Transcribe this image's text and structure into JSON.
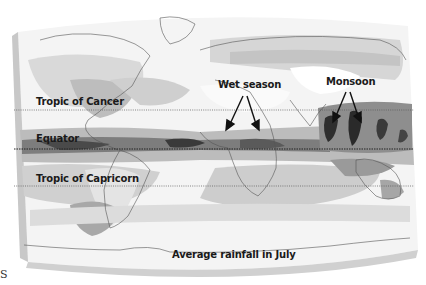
{
  "map": {
    "title": "Average rainfall in July",
    "labels": {
      "tropic_of_cancer": "Tropic of Cancer",
      "equator": "Equator",
      "tropic_of_capricorn": "Tropic of Capricorn",
      "wet_season": "Wet season",
      "monsoon": "Monsoon",
      "caption": "Average rainfall in July"
    },
    "lines": {
      "tropic_of_cancer_y": 110,
      "equator_y": 149,
      "tropic_of_capricorn_y": 186
    },
    "shading_colors": {
      "none": "#f7f7f7",
      "light": "#dedede",
      "medium": "#bdbdbd",
      "heavy": "#8a8a8a",
      "very_heavy": "#3a3a3a"
    }
  },
  "page_fragment": {
    "glyph": "S"
  }
}
